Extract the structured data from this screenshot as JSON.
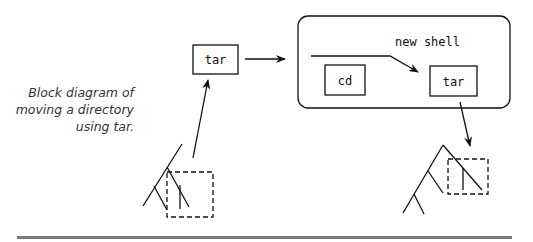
{
  "caption": {
    "lines": [
      "Block diagram of",
      "moving a directory",
      "using tar."
    ]
  },
  "diagram": {
    "left_box_label": "tar",
    "shell": {
      "label": "new shell",
      "cd_label": "cd",
      "tar_label": "tar"
    }
  },
  "colors": {
    "ink": "#111111",
    "caption": "#333333",
    "rule": "#7a7a7a",
    "background": "#ffffff"
  }
}
